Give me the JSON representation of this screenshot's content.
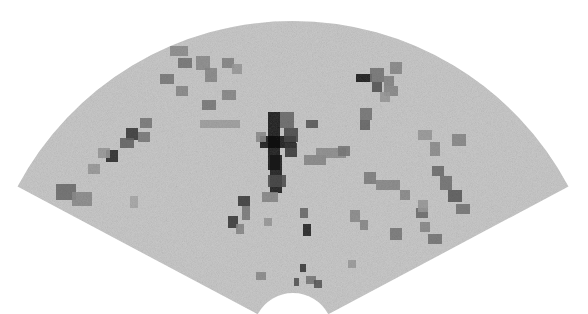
{
  "image": {
    "kind": "sonar-fan-scan",
    "description": "Grayscale fan-shaped (sector) sonar/ultrasound intensity image",
    "colors": {
      "background": "#ffffff",
      "fan_base": "#c9c9c9",
      "darkest": "#0a0a0a"
    },
    "fan": {
      "cx": 293,
      "cy": 333,
      "r_inner": 40,
      "r_outer": 312,
      "start_deg": 208,
      "end_deg": 332
    }
  },
  "blocks": [
    {
      "x": 268,
      "y": 112,
      "w": 12,
      "h": 58,
      "c": "#0d0d0d"
    },
    {
      "x": 260,
      "y": 136,
      "w": 36,
      "h": 12,
      "c": "#111111"
    },
    {
      "x": 270,
      "y": 155,
      "w": 12,
      "h": 38,
      "c": "#151515"
    },
    {
      "x": 280,
      "y": 112,
      "w": 14,
      "h": 16,
      "c": "#6a6a6a"
    },
    {
      "x": 284,
      "y": 128,
      "w": 14,
      "h": 14,
      "c": "#4a4a4a"
    },
    {
      "x": 285,
      "y": 143,
      "w": 12,
      "h": 14,
      "c": "#3a3a3a"
    },
    {
      "x": 268,
      "y": 175,
      "w": 18,
      "h": 12,
      "c": "#505050"
    },
    {
      "x": 306,
      "y": 120,
      "w": 12,
      "h": 8,
      "c": "#5a5a5a"
    },
    {
      "x": 304,
      "y": 155,
      "w": 22,
      "h": 10,
      "c": "#8a8a8a"
    },
    {
      "x": 256,
      "y": 132,
      "w": 10,
      "h": 10,
      "c": "#8d8d8d"
    },
    {
      "x": 262,
      "y": 192,
      "w": 16,
      "h": 10,
      "c": "#888888"
    },
    {
      "x": 356,
      "y": 74,
      "w": 16,
      "h": 8,
      "c": "#0e0e0e"
    },
    {
      "x": 370,
      "y": 68,
      "w": 14,
      "h": 14,
      "c": "#777777"
    },
    {
      "x": 372,
      "y": 82,
      "w": 10,
      "h": 10,
      "c": "#555555"
    },
    {
      "x": 384,
      "y": 86,
      "w": 14,
      "h": 10,
      "c": "#8a8a8a"
    },
    {
      "x": 360,
      "y": 108,
      "w": 12,
      "h": 12,
      "c": "#777777"
    },
    {
      "x": 360,
      "y": 120,
      "w": 10,
      "h": 10,
      "c": "#666666"
    },
    {
      "x": 380,
      "y": 92,
      "w": 10,
      "h": 10,
      "c": "#9a9a9a"
    },
    {
      "x": 316,
      "y": 148,
      "w": 30,
      "h": 10,
      "c": "#8f8f8f"
    },
    {
      "x": 338,
      "y": 146,
      "w": 12,
      "h": 10,
      "c": "#7a7a7a"
    },
    {
      "x": 364,
      "y": 172,
      "w": 12,
      "h": 12,
      "c": "#7f7f7f"
    },
    {
      "x": 376,
      "y": 180,
      "w": 24,
      "h": 10,
      "c": "#8a8a8a"
    },
    {
      "x": 400,
      "y": 190,
      "w": 10,
      "h": 10,
      "c": "#8c8c8c"
    },
    {
      "x": 416,
      "y": 208,
      "w": 12,
      "h": 10,
      "c": "#6e6e6e"
    },
    {
      "x": 420,
      "y": 222,
      "w": 10,
      "h": 10,
      "c": "#8a8a8a"
    },
    {
      "x": 428,
      "y": 234,
      "w": 14,
      "h": 10,
      "c": "#777777"
    },
    {
      "x": 390,
      "y": 228,
      "w": 12,
      "h": 12,
      "c": "#7a7a7a"
    },
    {
      "x": 350,
      "y": 210,
      "w": 10,
      "h": 12,
      "c": "#8d8d8d"
    },
    {
      "x": 418,
      "y": 130,
      "w": 14,
      "h": 10,
      "c": "#9a9a9a"
    },
    {
      "x": 430,
      "y": 142,
      "w": 10,
      "h": 14,
      "c": "#8e8e8e"
    },
    {
      "x": 452,
      "y": 134,
      "w": 14,
      "h": 12,
      "c": "#888888"
    },
    {
      "x": 432,
      "y": 166,
      "w": 12,
      "h": 10,
      "c": "#6e6e6e"
    },
    {
      "x": 440,
      "y": 176,
      "w": 12,
      "h": 14,
      "c": "#737373"
    },
    {
      "x": 448,
      "y": 190,
      "w": 14,
      "h": 12,
      "c": "#5c5c5c"
    },
    {
      "x": 456,
      "y": 204,
      "w": 14,
      "h": 10,
      "c": "#777777"
    },
    {
      "x": 418,
      "y": 200,
      "w": 10,
      "h": 12,
      "c": "#9a9a9a"
    },
    {
      "x": 390,
      "y": 62,
      "w": 12,
      "h": 12,
      "c": "#8a8a8a"
    },
    {
      "x": 384,
      "y": 76,
      "w": 10,
      "h": 10,
      "c": "#858585"
    },
    {
      "x": 170,
      "y": 46,
      "w": 18,
      "h": 10,
      "c": "#8e8e8e"
    },
    {
      "x": 178,
      "y": 58,
      "w": 14,
      "h": 10,
      "c": "#777777"
    },
    {
      "x": 196,
      "y": 56,
      "w": 14,
      "h": 14,
      "c": "#8d8d8d"
    },
    {
      "x": 205,
      "y": 68,
      "w": 12,
      "h": 14,
      "c": "#8a8a8a"
    },
    {
      "x": 222,
      "y": 58,
      "w": 12,
      "h": 10,
      "c": "#858585"
    },
    {
      "x": 232,
      "y": 64,
      "w": 10,
      "h": 10,
      "c": "#9a9a9a"
    },
    {
      "x": 160,
      "y": 74,
      "w": 14,
      "h": 10,
      "c": "#7a7a7a"
    },
    {
      "x": 176,
      "y": 86,
      "w": 12,
      "h": 10,
      "c": "#8a8a8a"
    },
    {
      "x": 222,
      "y": 90,
      "w": 14,
      "h": 10,
      "c": "#888888"
    },
    {
      "x": 202,
      "y": 100,
      "w": 14,
      "h": 10,
      "c": "#7a7a7a"
    },
    {
      "x": 140,
      "y": 118,
      "w": 12,
      "h": 10,
      "c": "#7a7a7a"
    },
    {
      "x": 126,
      "y": 128,
      "w": 12,
      "h": 12,
      "c": "#3a3a3a"
    },
    {
      "x": 120,
      "y": 138,
      "w": 14,
      "h": 10,
      "c": "#666666"
    },
    {
      "x": 138,
      "y": 132,
      "w": 12,
      "h": 10,
      "c": "#7a7a7a"
    },
    {
      "x": 106,
      "y": 150,
      "w": 12,
      "h": 12,
      "c": "#2a2a2a"
    },
    {
      "x": 98,
      "y": 148,
      "w": 12,
      "h": 10,
      "c": "#9a9a9a"
    },
    {
      "x": 88,
      "y": 164,
      "w": 12,
      "h": 10,
      "c": "#9a9a9a"
    },
    {
      "x": 56,
      "y": 184,
      "w": 20,
      "h": 16,
      "c": "#6e6e6e"
    },
    {
      "x": 72,
      "y": 192,
      "w": 20,
      "h": 14,
      "c": "#8c8c8c"
    },
    {
      "x": 200,
      "y": 120,
      "w": 40,
      "h": 8,
      "c": "#a0a0a0"
    },
    {
      "x": 228,
      "y": 216,
      "w": 10,
      "h": 12,
      "c": "#3a3a3a"
    },
    {
      "x": 236,
      "y": 224,
      "w": 8,
      "h": 10,
      "c": "#8a8a8a"
    },
    {
      "x": 300,
      "y": 208,
      "w": 8,
      "h": 10,
      "c": "#6a6a6a"
    },
    {
      "x": 303,
      "y": 224,
      "w": 8,
      "h": 12,
      "c": "#1e1e1e"
    },
    {
      "x": 300,
      "y": 264,
      "w": 6,
      "h": 8,
      "c": "#3a3a3a"
    },
    {
      "x": 294,
      "y": 278,
      "w": 5,
      "h": 8,
      "c": "#555555"
    },
    {
      "x": 306,
      "y": 276,
      "w": 10,
      "h": 8,
      "c": "#7a7a7a"
    },
    {
      "x": 314,
      "y": 280,
      "w": 8,
      "h": 8,
      "c": "#5a5a5a"
    },
    {
      "x": 256,
      "y": 272,
      "w": 10,
      "h": 8,
      "c": "#8d8d8d"
    },
    {
      "x": 264,
      "y": 218,
      "w": 8,
      "h": 8,
      "c": "#9a9a9a"
    },
    {
      "x": 360,
      "y": 220,
      "w": 8,
      "h": 10,
      "c": "#8a8a8a"
    },
    {
      "x": 348,
      "y": 260,
      "w": 8,
      "h": 8,
      "c": "#9c9c9c"
    },
    {
      "x": 130,
      "y": 196,
      "w": 8,
      "h": 12,
      "c": "#a8a8a8"
    },
    {
      "x": 238,
      "y": 196,
      "w": 12,
      "h": 10,
      "c": "#3c3c3c"
    },
    {
      "x": 242,
      "y": 206,
      "w": 8,
      "h": 14,
      "c": "#7c7c7c"
    }
  ]
}
